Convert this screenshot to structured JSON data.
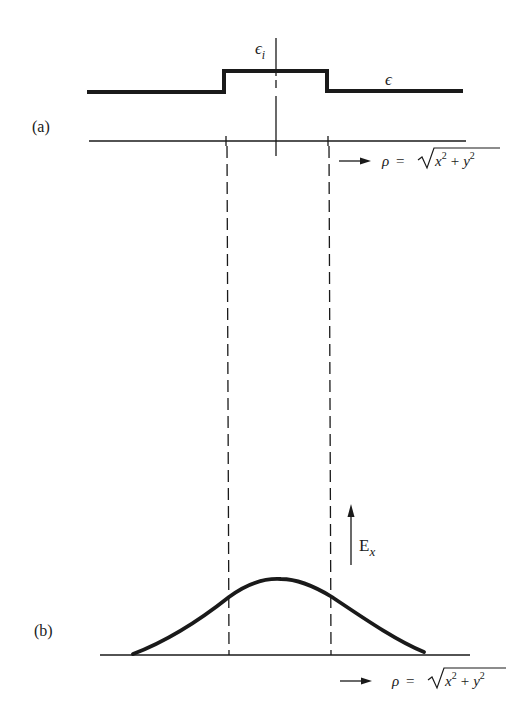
{
  "figure": {
    "panel_a": {
      "label": "(a)",
      "profile_name": "permittivity",
      "core_symbol": "ϵ",
      "core_subscript": "i",
      "cladding_symbol": "ϵ",
      "axis_formula": {
        "rho": "ρ",
        "equals": "=",
        "radicand_x": "x",
        "exp_x": "2",
        "plus": "+",
        "radicand_y": "y",
        "exp_y": "2"
      }
    },
    "panel_b": {
      "label": "(b)",
      "field_symbol": "E",
      "field_subscript": "x",
      "axis_formula": {
        "rho": "ρ",
        "equals": "=",
        "radicand_x": "x",
        "exp_x": "2",
        "plus": "+",
        "radicand_y": "y",
        "exp_y": "2"
      }
    },
    "colors": {
      "ink": "#1a1a1a",
      "background": "#ffffff"
    }
  }
}
